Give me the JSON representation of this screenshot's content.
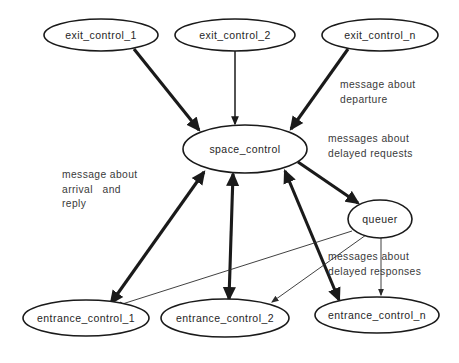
{
  "diagram": {
    "type": "directed-graph",
    "background_color": "#ffffff",
    "line_color": "#1a1a1a",
    "text_color": "#262626",
    "nodes": [
      {
        "id": "exit_control_1",
        "label": "exit_control_1",
        "cx": 101,
        "cy": 35,
        "rx": 57,
        "ry": 16
      },
      {
        "id": "exit_control_2",
        "label": "exit_control_2",
        "cx": 235,
        "cy": 35,
        "rx": 60,
        "ry": 16
      },
      {
        "id": "exit_control_n",
        "label": "exit_control_n",
        "cx": 380,
        "cy": 35,
        "rx": 58,
        "ry": 16
      },
      {
        "id": "space_control",
        "label": "space_control",
        "cx": 245,
        "cy": 149,
        "rx": 62,
        "ry": 24
      },
      {
        "id": "queuer",
        "label": "queuer",
        "cx": 380,
        "cy": 219,
        "rx": 32,
        "ry": 19
      },
      {
        "id": "entrance_control_1",
        "label": "entrance_control_1",
        "cx": 86,
        "cy": 318,
        "rx": 63,
        "ry": 18
      },
      {
        "id": "entrance_control_2",
        "label": "entrance_control_2",
        "cx": 225,
        "cy": 318,
        "rx": 64,
        "ry": 19
      },
      {
        "id": "entrance_control_n",
        "label": "entrance_control_n",
        "cx": 377,
        "cy": 315,
        "rx": 62,
        "ry": 18
      }
    ],
    "edges": [
      {
        "from": "exit_control_1",
        "to": "space_control",
        "weight": "thick",
        "arrows": "one-way"
      },
      {
        "from": "exit_control_2",
        "to": "space_control",
        "weight": "medium",
        "arrows": "one-way"
      },
      {
        "from": "exit_control_n",
        "to": "space_control",
        "weight": "thick",
        "arrows": "one-way"
      },
      {
        "from": "space_control",
        "to": "queuer",
        "weight": "thick",
        "arrows": "one-way"
      },
      {
        "from": "entrance_control_1",
        "to": "space_control",
        "weight": "thick",
        "arrows": "two-way"
      },
      {
        "from": "entrance_control_2",
        "to": "space_control",
        "weight": "thick",
        "arrows": "two-way"
      },
      {
        "from": "entrance_control_n",
        "to": "space_control",
        "weight": "thick",
        "arrows": "two-way"
      },
      {
        "from": "queuer",
        "to": "entrance_control_1",
        "weight": "thin",
        "arrows": "one-way"
      },
      {
        "from": "queuer",
        "to": "entrance_control_2",
        "weight": "thin",
        "arrows": "one-way"
      },
      {
        "from": "queuer",
        "to": "entrance_control_n",
        "weight": "thin",
        "arrows": "one-way"
      }
    ],
    "edge_labels": [
      {
        "id": "departure-label",
        "text": "message about\ndeparture",
        "x": 340,
        "y": 78
      },
      {
        "id": "delayed-requests-label",
        "text": "messages about\ndelayed requests",
        "x": 328,
        "y": 132
      },
      {
        "id": "arrival-reply-label",
        "text": "message about\narrival   and\nreply",
        "x": 62,
        "y": 168
      },
      {
        "id": "delayed-responses-label",
        "text": "messages about\ndelayed responses",
        "x": 328,
        "y": 250
      }
    ]
  }
}
